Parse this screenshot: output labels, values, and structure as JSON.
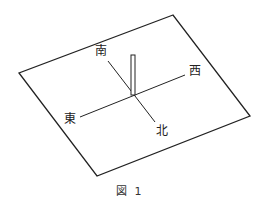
{
  "figure": {
    "caption": "図 1",
    "labels": {
      "south": "南",
      "west": "西",
      "east": "東",
      "north": "北"
    },
    "colors": {
      "stroke": "#222222",
      "background": "#ffffff"
    }
  }
}
